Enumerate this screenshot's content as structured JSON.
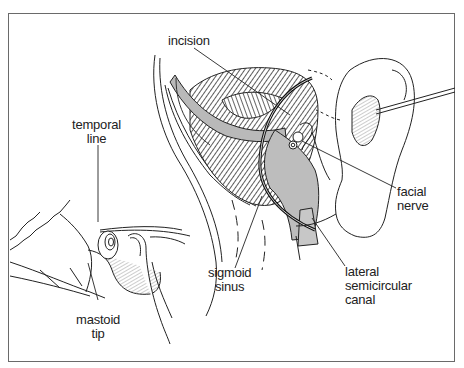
{
  "figure": {
    "colors": {
      "frame": "#6a6a6a",
      "line": "#1e1e1e",
      "shade": "#b9b9b9",
      "incision": "#111111"
    }
  },
  "labels": {
    "incision": {
      "line1": "incision"
    },
    "temporal_line": {
      "line1": "temporal",
      "line2": "line"
    },
    "mastoid_tip": {
      "line1": "mastoid",
      "line2": "tip"
    },
    "sigmoid_sinus": {
      "line1": "sigmoid",
      "line2": "sinus"
    },
    "lateral_semicircular_canal": {
      "line1": "lateral",
      "line2": "semicircular",
      "line3": "canal"
    },
    "facial_nerve": {
      "line1": "facial",
      "line2": "nerve"
    }
  }
}
